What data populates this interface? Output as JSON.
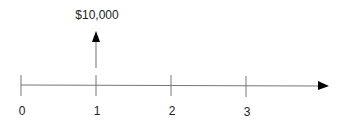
{
  "diagram": {
    "type": "cash-flow-timeline",
    "periods": [
      "0",
      "1",
      "2",
      "3"
    ],
    "cash_flows": [
      {
        "period": "1",
        "amount_label": "$10,000",
        "direction": "inflow-up"
      }
    ],
    "colors": {
      "line": "#777777",
      "arrow": "#000000",
      "text": "#222222"
    }
  }
}
